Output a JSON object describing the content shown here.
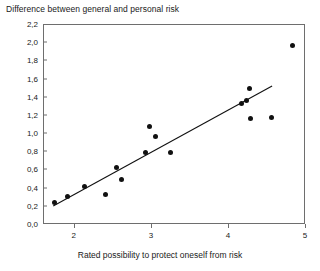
{
  "chart_data": {
    "type": "scatter",
    "title": "Difference between general and personal risk",
    "xlabel": "Rated possibility to protect oneself from risk",
    "ylabel": "",
    "xlim": [
      1.6,
      5.0
    ],
    "ylim": [
      0.0,
      2.2
    ],
    "grid": false,
    "legend": "none",
    "x_ticks": [
      "2",
      "3",
      "4",
      "5"
    ],
    "x_tick_values": [
      2,
      3,
      4,
      5
    ],
    "y_ticks": [
      "0,0",
      "0,2",
      "0,4",
      "0,6",
      "0,8",
      "1,0",
      "1,2",
      "1,4",
      "1,6",
      "1,8",
      "2,0",
      "2,2"
    ],
    "y_tick_values": [
      0.0,
      0.2,
      0.4,
      0.6,
      0.8,
      1.0,
      1.2,
      1.4,
      1.6,
      1.8,
      2.0,
      2.2
    ],
    "points": [
      {
        "x": 1.74,
        "y": 0.25
      },
      {
        "x": 1.9,
        "y": 0.31
      },
      {
        "x": 2.12,
        "y": 0.42
      },
      {
        "x": 2.4,
        "y": 0.34
      },
      {
        "x": 2.54,
        "y": 0.63
      },
      {
        "x": 2.61,
        "y": 0.5
      },
      {
        "x": 2.92,
        "y": 0.8
      },
      {
        "x": 2.97,
        "y": 1.08
      },
      {
        "x": 3.05,
        "y": 0.97
      },
      {
        "x": 3.24,
        "y": 0.8
      },
      {
        "x": 4.16,
        "y": 1.34
      },
      {
        "x": 4.23,
        "y": 1.37
      },
      {
        "x": 4.27,
        "y": 1.5
      },
      {
        "x": 4.28,
        "y": 1.17
      },
      {
        "x": 4.55,
        "y": 1.18
      },
      {
        "x": 4.82,
        "y": 1.97
      }
    ],
    "trendline": {
      "type": "linear-fit",
      "x_start": 1.72,
      "y_start": 0.21,
      "x_end": 4.56,
      "y_end": 1.53
    },
    "marker_color": "#111111",
    "line_color": "#111111",
    "axis_color": "#6e6e6e"
  }
}
